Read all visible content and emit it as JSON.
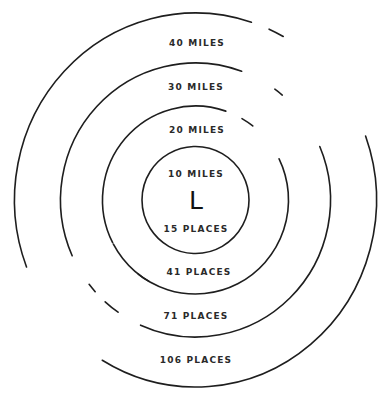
{
  "diagram": {
    "center": {
      "x": 195.5,
      "y": 200,
      "letter": "L"
    },
    "rings": [
      {
        "distance_label": "10 MILES",
        "places_label": "15 PLACES",
        "rx": 53.5,
        "ry": 53.5
      },
      {
        "distance_label": "20 MILES",
        "places_label": "41 PLACES",
        "rx": 93,
        "ry": 94
      },
      {
        "distance_label": "30 MILES",
        "places_label": "71 PLACES",
        "rx": 135,
        "ry": 137
      },
      {
        "distance_label": "40 MILES",
        "places_label": "106 PLACES",
        "rx": 181,
        "ry": 187
      }
    ],
    "stroke_color": "#1e1e1e",
    "background_color": "#ffffff"
  }
}
